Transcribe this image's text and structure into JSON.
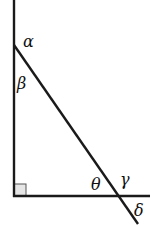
{
  "diagram": {
    "type": "right-triangle-angles",
    "labels": {
      "alpha": "α",
      "beta": "β",
      "theta": "θ",
      "gamma": "γ",
      "delta": "δ"
    },
    "right_angle_marker": true,
    "colors": {
      "line": "#1a1a1a",
      "marker_fill": "#e6e6e6",
      "background": "#ffffff"
    }
  }
}
